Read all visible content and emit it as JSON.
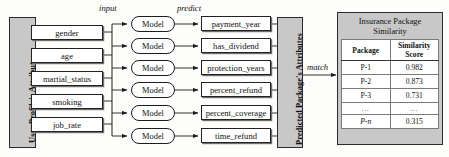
{
  "figure": {
    "left_panel_label": "User Profile's Attributes",
    "right_panel_label": "Predicted Package's Attributes"
  },
  "flow_labels": {
    "input": "input",
    "predict": "predict",
    "match": "match"
  },
  "user_attributes": [
    {
      "label": "gender"
    },
    {
      "label": "age"
    },
    {
      "label": "martial_status"
    },
    {
      "label": "smoking"
    },
    {
      "label": "job_rate"
    }
  ],
  "models": [
    {
      "label": "Model"
    },
    {
      "label": "Model"
    },
    {
      "label": "Model"
    },
    {
      "label": "Model"
    },
    {
      "label": "Model"
    },
    {
      "label": "Model"
    }
  ],
  "predicted_attributes": [
    {
      "label": "payment_year"
    },
    {
      "label": "has_dividend"
    },
    {
      "label": "protection_years"
    },
    {
      "label": "percent_refund"
    },
    {
      "label": "percent_coverage"
    },
    {
      "label": "time_refund"
    }
  ],
  "similarity_table": {
    "title_line1": "Insurance Package",
    "title_line2": "Similarity",
    "headers": {
      "package": "Package",
      "score_line1": "Similarity",
      "score_line2": "Score"
    },
    "rows": [
      {
        "package": "P-1",
        "score": "0.982"
      },
      {
        "package": "P-2",
        "score": "0.873"
      },
      {
        "package": "P-3",
        "score": "0.731"
      },
      {
        "package": "…",
        "score": "…"
      },
      {
        "package": "P-n",
        "score": "0.315"
      }
    ]
  },
  "colors": {
    "panel_grey": "#c8c8c8",
    "box_white": "#ffffff",
    "line_dark": "#222222",
    "page_bg": "#fdfdfb"
  }
}
